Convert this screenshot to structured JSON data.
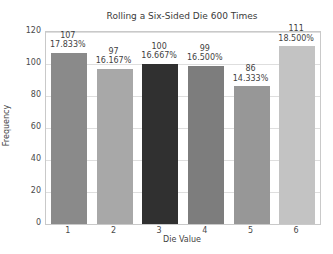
{
  "chart_data": {
    "type": "bar",
    "title": "Rolling a Six-Sided Die 600 Times",
    "xlabel": "Die Value",
    "ylabel": "Frequency",
    "categories": [
      "1",
      "2",
      "3",
      "4",
      "5",
      "6"
    ],
    "values": [
      107,
      97,
      100,
      99,
      86,
      111
    ],
    "percent_labels": [
      "17.833%",
      "16.167%",
      "16.667%",
      "16.500%",
      "14.333%",
      "18.500%"
    ],
    "bar_colors": [
      "#8a8a8a",
      "#a8a8a8",
      "#303030",
      "#7d7d7d",
      "#979797",
      "#c3c3c3"
    ],
    "yticks": [
      0,
      20,
      40,
      60,
      80,
      100,
      120
    ],
    "ylim": [
      0,
      120
    ],
    "grid": true,
    "legend": "none",
    "label_color": "#3f3f3f",
    "gridline_color": "#dedede"
  }
}
